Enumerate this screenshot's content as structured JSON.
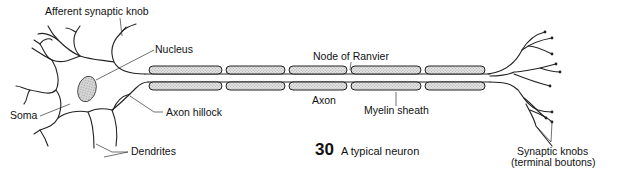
{
  "figure": {
    "number": "30",
    "caption": "A typical neuron"
  },
  "labels": {
    "afferent_synaptic_knob": "Afferent synaptic knob",
    "nucleus": "Nucleus",
    "soma": "Soma",
    "axon_hillock": "Axon hillock",
    "dendrites": "Dendrites",
    "node_of_ranvier": "Node of Ranvier",
    "axon": "Axon",
    "myelin_sheath": "Myelin sheath",
    "synaptic_knobs_line1": "Synaptic knobs",
    "synaptic_knobs_line2": "(terminal boutons)"
  },
  "colors": {
    "line": "#222222",
    "background": "#ffffff",
    "stipple": "#bdbdbd"
  }
}
